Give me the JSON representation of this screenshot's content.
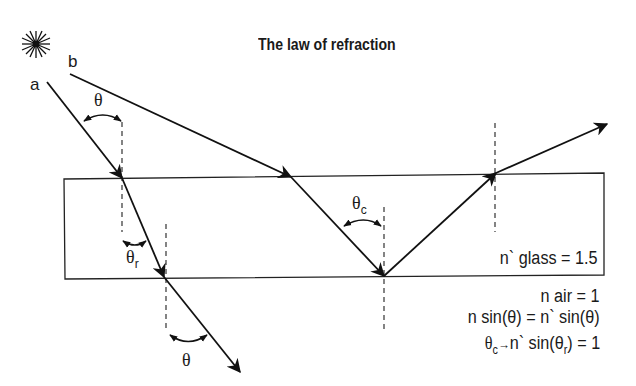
{
  "title": "The law of refraction",
  "source_icon": "sun-light-source",
  "rays": [
    {
      "label": "a",
      "type": "refraction"
    },
    {
      "label": "b",
      "type": "total-internal-reflection"
    }
  ],
  "angles": {
    "incident": "θ",
    "refracted": "θ",
    "refracted_sub": "r",
    "exit": "θ",
    "critical": "θ",
    "critical_sub": "c"
  },
  "medium": {
    "glass_label": "n` glass = 1.5",
    "air_label": "n air = 1"
  },
  "equations": {
    "snell": "n sin(θ) = n` sin(θ)",
    "critical_prefix": "θ",
    "critical_sub": "c",
    "critical_rest": "n` sin(θ",
    "critical_rest_sub": "r",
    "critical_end": ") = 1"
  },
  "colors": {
    "line": "#111111",
    "dashed": "#444444",
    "background": "#ffffff"
  }
}
